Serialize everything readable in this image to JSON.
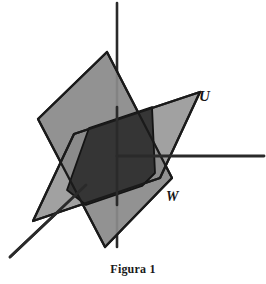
{
  "figure": {
    "caption": "Figura 1",
    "background_color": "#ffffff",
    "stroke_color": "#1a1a1a",
    "labels": {
      "u_plane": "U",
      "w_plane": "W"
    },
    "colors": {
      "plane_light": "#8a8a8a",
      "plane_mid": "#7e7e7e",
      "plane_overlap_dark": "#303030",
      "axis": "#2a2a2a"
    },
    "geometry": {
      "origin": [
        117,
        156
      ],
      "axes": [
        {
          "name": "vertical-axis",
          "from": [
            117,
            3
          ],
          "to": [
            117,
            247
          ]
        },
        {
          "name": "horizontal-axis",
          "from": [
            117,
            156
          ],
          "to": [
            264,
            156
          ]
        },
        {
          "name": "diagonal-axis",
          "from": [
            117,
            156
          ],
          "to": [
            10,
            257
          ]
        }
      ],
      "plane_w": {
        "label": "W",
        "vertices": [
          [
            107,
            52
          ],
          [
            38,
            119
          ],
          [
            105,
            247
          ],
          [
            172,
            178
          ]
        ]
      },
      "plane_u": {
        "label": "U",
        "vertices": [
          [
            74,
            134
          ],
          [
            200,
            92
          ],
          [
            160,
            178
          ],
          [
            33,
            221
          ]
        ]
      },
      "overlap": {
        "name": "intersection-region",
        "vertices": [
          [
            89,
            128
          ],
          [
            152,
            107
          ],
          [
            155,
            173
          ],
          [
            142,
            186
          ],
          [
            86,
            205
          ],
          [
            67,
            190
          ]
        ]
      }
    }
  }
}
